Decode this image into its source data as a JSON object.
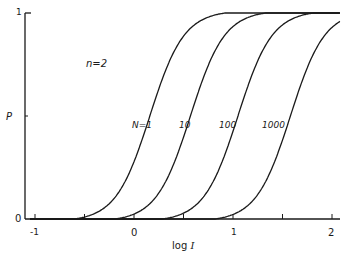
{
  "chart_data": {
    "type": "line",
    "title": "",
    "annotation": "n=2",
    "xlabel": "log I",
    "ylabel": "P",
    "xlim": [
      -1.1,
      2.1
    ],
    "ylim": [
      0,
      1
    ],
    "x_ticks": [
      -1,
      -0.5,
      0,
      0.5,
      1,
      1.5,
      2
    ],
    "x_tick_labels": [
      "-1",
      "",
      "0",
      "",
      "1",
      "",
      "2"
    ],
    "y_ticks": [
      0,
      0.5,
      1
    ],
    "y_tick_labels": [
      "0",
      "",
      "1"
    ],
    "grid": false,
    "legend": "inline labels near curves at P≈0.5",
    "series": [
      {
        "name": "N=1",
        "label": "N=1",
        "x_at_half": 0.16,
        "points": [
          [
            -1.0,
            0.0
          ],
          [
            -0.5,
            0.06
          ],
          [
            0.0,
            0.33
          ],
          [
            0.16,
            0.5
          ],
          [
            0.5,
            0.86
          ],
          [
            0.85,
            1.0
          ]
        ]
      },
      {
        "name": "N=10",
        "label": "10",
        "x_at_half": 0.57,
        "points": [
          [
            -0.5,
            0.0
          ],
          [
            0.0,
            0.1
          ],
          [
            0.57,
            0.5
          ],
          [
            1.0,
            0.9
          ],
          [
            1.18,
            1.0
          ]
        ]
      },
      {
        "name": "N=100",
        "label": "100",
        "x_at_half": 1.05,
        "points": [
          [
            0.0,
            0.0
          ],
          [
            0.5,
            0.08
          ],
          [
            1.0,
            0.45
          ],
          [
            1.05,
            0.5
          ],
          [
            1.5,
            0.93
          ],
          [
            1.58,
            1.0
          ]
        ]
      },
      {
        "name": "N=1000",
        "label": "1000",
        "x_at_half": 1.58,
        "points": [
          [
            0.5,
            0.0
          ],
          [
            1.0,
            0.08
          ],
          [
            1.58,
            0.5
          ],
          [
            2.0,
            0.92
          ],
          [
            2.08,
            1.0
          ]
        ]
      }
    ]
  },
  "labels": {
    "annotation": "n=2",
    "ylabel": "P",
    "xlabel": "log I",
    "y_top": "1",
    "y_bottom": "0",
    "x_m1": "-1",
    "x_0": "0",
    "x_1": "1",
    "x_2": "2",
    "curve_n1": "N=1",
    "curve_n10": "10",
    "curve_n100": "100",
    "curve_n1000": "1000"
  }
}
